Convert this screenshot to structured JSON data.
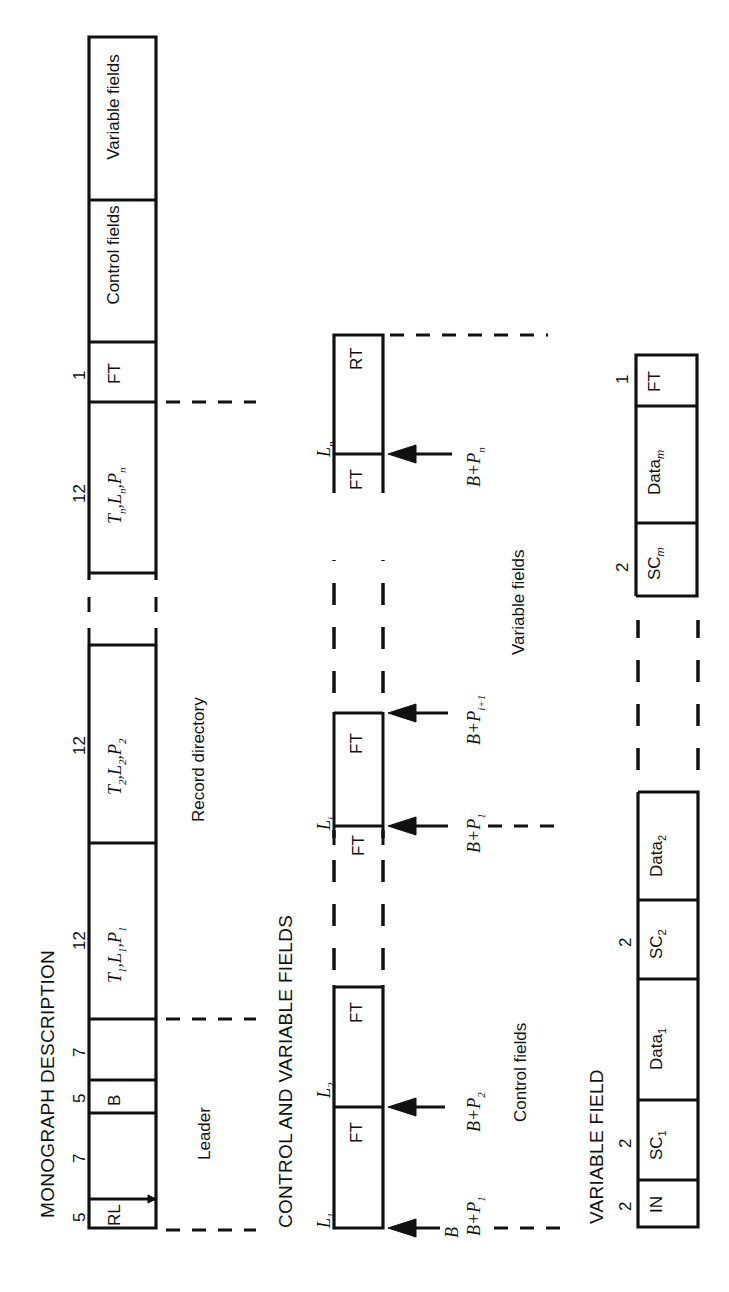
{
  "panels": {
    "monograph": {
      "title": "MONOGRAPH DESCRIPTION",
      "segments": [
        {
          "label": "RL",
          "size": "5"
        },
        {
          "label": "",
          "size": "7"
        },
        {
          "label": "B",
          "size": "5"
        },
        {
          "label": "",
          "size": "7"
        },
        {
          "label": "T1,L1,P1",
          "size": "12"
        },
        {
          "label": "T2,L2,P2",
          "size": "12"
        },
        {
          "label": "Tn,Ln,Pn",
          "size": "12"
        },
        {
          "label": "FT",
          "size": "1"
        },
        {
          "label": "Control fields",
          "size": ""
        },
        {
          "label": "Variable fields",
          "size": ""
        }
      ],
      "annotations": {
        "leader": "Leader",
        "record_directory": "Record directory"
      }
    },
    "control_variable": {
      "title": "CONTROL AND VARIABLE FIELDS",
      "cells": [
        "FT",
        "FT",
        "FT",
        "FT",
        "FT",
        "RT"
      ],
      "length_labels": [
        "L1",
        "L2",
        "Li",
        "Ln"
      ],
      "pointers": [
        "B",
        "B+P1",
        "B+P2",
        "B+P1",
        "B+Pi+1",
        "B+Pn"
      ],
      "annotations": {
        "control_fields": "Control fields",
        "variable_fields": "Variable fields"
      }
    },
    "variable_field": {
      "title": "VARIABLE FIELD",
      "segments": [
        {
          "label": "IN",
          "size": "2"
        },
        {
          "label": "SC1",
          "size": "2"
        },
        {
          "label": "Data1",
          "size": ""
        },
        {
          "label": "SC2",
          "size": "2"
        },
        {
          "label": "Data2",
          "size": ""
        },
        {
          "label": "SCm",
          "size": "2"
        },
        {
          "label": "Datam",
          "size": ""
        },
        {
          "label": "FT",
          "size": "1"
        }
      ]
    }
  }
}
